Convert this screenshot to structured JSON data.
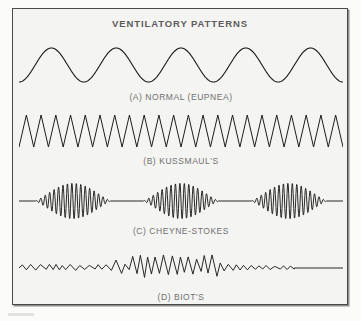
{
  "figure": {
    "title": "VENTILATORY PATTERNS",
    "background_color": "#f4f4f2",
    "border_color": "#4a4a4a",
    "trace_color": "#1d1d1d",
    "label_color": "#707070"
  },
  "chart_data": {
    "type": "line",
    "title": "VENTILATORY PATTERNS",
    "xlabel": "",
    "ylabel": "",
    "grid": false,
    "legend_position": "none",
    "series": [
      {
        "key": "normal",
        "name": "(A) NORMAL (EUPNEA)",
        "letter": "A",
        "pattern_name": "NORMAL (EUPNEA)",
        "waveform": "regular-smooth-sine",
        "cycles": 5,
        "amplitude": 1.0,
        "rate": "regular",
        "depth": "normal",
        "apnea": false
      },
      {
        "key": "kussmauls",
        "name": "(B) KUSSMAUL'S",
        "letter": "B",
        "pattern_name": "KUSSMAUL'S",
        "waveform": "rapid-deep-zigzag",
        "cycles": 22,
        "amplitude": 1.0,
        "rate": "rapid",
        "depth": "deep",
        "apnea": false
      },
      {
        "key": "cheyne-stokes",
        "name": "(C) CHEYNE-STOKES",
        "letter": "C",
        "pattern_name": "CHEYNE-STOKES",
        "waveform": "crescendo-decrescendo-with-apnea",
        "clusters": 3,
        "cycles_per_cluster": 17,
        "amplitude": 1.0,
        "rate": "waxing-waning",
        "depth": "variable",
        "apnea": true
      },
      {
        "key": "biots",
        "name": "(D) BIOT'S",
        "letter": "D",
        "pattern_name": "BIOT'S",
        "waveform": "irregular-shallow-with-deep-burst",
        "cycles": 34,
        "amplitude": 0.85,
        "rate": "irregular",
        "depth": "irregular",
        "apnea": true
      }
    ]
  }
}
